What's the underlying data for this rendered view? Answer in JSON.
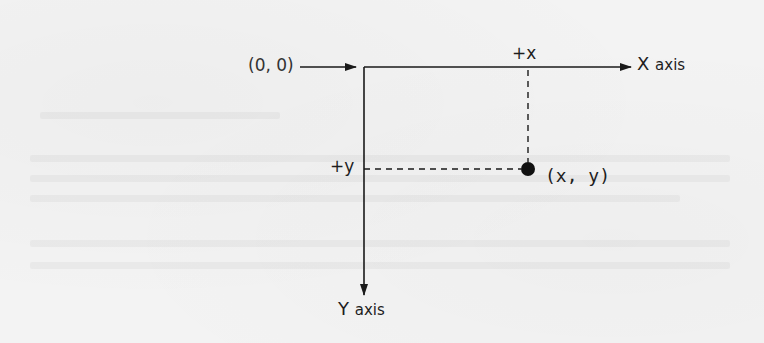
{
  "diagram": {
    "origin": {
      "label": "(0, 0)",
      "x": 364,
      "y": 67
    },
    "x_axis": {
      "letter": "X",
      "word": "axis",
      "tick_label": "+x",
      "direction": "right"
    },
    "y_axis": {
      "letter": "Y",
      "word": "axis",
      "tick_label": "+y",
      "direction": "down"
    },
    "point": {
      "label": "(x, y)",
      "px": 528,
      "py": 169
    },
    "colors": {
      "ink": "#1a1a1a",
      "paper": "#f3f3f3"
    }
  }
}
